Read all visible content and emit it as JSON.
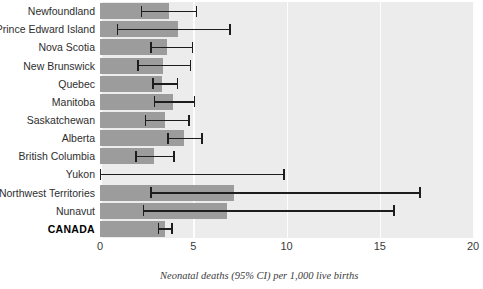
{
  "chart_data": {
    "type": "bar",
    "orientation": "horizontal",
    "title": "",
    "xlabel": "Neonatal deaths (95% CI) per 1,000 live births",
    "ylabel": "",
    "xlim": [
      0,
      20
    ],
    "xticks": [
      0,
      5,
      10,
      15,
      20
    ],
    "xtick_labels": [
      "0",
      "5",
      "10",
      "15",
      "20"
    ],
    "grid": true,
    "grid_axis": "x",
    "legend": false,
    "categories": [
      "Newfoundland",
      "Prince Edward Island",
      "Nova Scotia",
      "New Brunswick",
      "Quebec",
      "Manitoba",
      "Saskatchewan",
      "Alberta",
      "British Columbia",
      "Yukon",
      "Northwest Territories",
      "Nunavut",
      "CANADA"
    ],
    "values": [
      3.7,
      4.2,
      3.6,
      3.4,
      3.3,
      3.9,
      3.5,
      4.5,
      2.9,
      0.0,
      7.2,
      6.8,
      3.5
    ],
    "ci_lower": [
      2.2,
      0.9,
      2.7,
      2.0,
      2.8,
      2.9,
      2.4,
      3.6,
      1.9,
      0.0,
      2.7,
      2.3,
      3.1
    ],
    "ci_upper": [
      5.2,
      7.0,
      5.0,
      4.9,
      4.2,
      5.1,
      4.8,
      5.5,
      4.0,
      9.9,
      17.2,
      15.8,
      3.9
    ],
    "bar_color": "#9c9c9c",
    "error_color": "#1d1d1d",
    "plot_background": "#ececec",
    "gridline_color": "#fdfdfd",
    "highlight_category": "CANADA"
  },
  "axis": {
    "caption": "Neonatal deaths (95% CI) per 1,000 live births"
  }
}
